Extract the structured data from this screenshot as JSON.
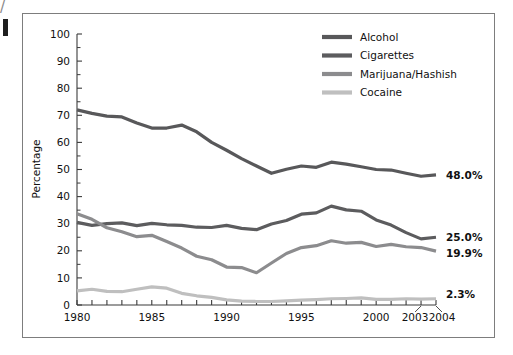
{
  "chart_data": {
    "type": "line",
    "title": "",
    "subtitle": "",
    "xlabel": "",
    "ylabel": "Percentage",
    "xlim": [
      1980,
      2004
    ],
    "ylim": [
      0,
      100
    ],
    "grid": false,
    "legend_position": "top-right",
    "x": [
      1980,
      1981,
      1982,
      1983,
      1984,
      1985,
      1986,
      1987,
      1988,
      1989,
      1990,
      1991,
      1992,
      1993,
      1994,
      1995,
      1996,
      1997,
      1998,
      1999,
      2000,
      2001,
      2002,
      2003,
      2004
    ],
    "xticks": [
      1980,
      1985,
      1990,
      1995,
      2000,
      2003,
      2004
    ],
    "xticklabels": [
      "1980",
      "1985",
      "1990",
      "1995",
      "2000",
      "2003",
      "2004"
    ],
    "yticks": [
      0,
      10,
      20,
      30,
      40,
      50,
      60,
      70,
      80,
      90,
      100
    ],
    "yticklabels": [
      "0",
      "10",
      "20",
      "30",
      "40",
      "50",
      "60",
      "70",
      "80",
      "90",
      "100"
    ],
    "yticks_minor": [
      5,
      15,
      25,
      35,
      45,
      55,
      65,
      75,
      85,
      95
    ],
    "series": [
      {
        "name": "Alcohol",
        "color": "#58585a",
        "end_label": "48.0%",
        "values": [
          72.0,
          70.7,
          69.7,
          69.4,
          67.2,
          65.3,
          65.3,
          66.4,
          63.9,
          60.0,
          57.1,
          54.0,
          51.3,
          48.6,
          50.1,
          51.3,
          50.8,
          52.7,
          52.0,
          51.0,
          50.0,
          49.8,
          48.6,
          47.5,
          48.0
        ]
      },
      {
        "name": "Cigarettes",
        "color": "#5c5c5e",
        "end_label": "25.0%",
        "values": [
          30.5,
          29.4,
          30.0,
          30.3,
          29.3,
          30.1,
          29.6,
          29.4,
          28.7,
          28.6,
          29.4,
          28.3,
          27.8,
          29.9,
          31.2,
          33.5,
          34.0,
          36.5,
          35.1,
          34.6,
          31.4,
          29.5,
          26.7,
          24.4,
          25.0
        ]
      },
      {
        "name": "Marijuana/Hashish",
        "color": "#8c8c8e",
        "end_label": "19.9%",
        "values": [
          33.7,
          31.6,
          28.5,
          27.0,
          25.2,
          25.7,
          23.4,
          21.0,
          18.0,
          16.7,
          14.0,
          13.8,
          11.9,
          15.5,
          19.0,
          21.2,
          21.9,
          23.7,
          22.8,
          23.1,
          21.6,
          22.4,
          21.5,
          21.2,
          19.9
        ]
      },
      {
        "name": "Cocaine",
        "color": "#bfbfbf",
        "end_label": "2.3%",
        "values": [
          5.2,
          5.8,
          5.0,
          4.9,
          5.8,
          6.7,
          6.2,
          4.3,
          3.4,
          2.8,
          1.9,
          1.4,
          1.3,
          1.3,
          1.5,
          1.8,
          2.0,
          2.3,
          2.4,
          2.6,
          2.1,
          2.1,
          2.3,
          2.2,
          2.3
        ]
      }
    ],
    "legend": [
      {
        "label": "Alcohol",
        "color": "#58585a"
      },
      {
        "label": "Cigarettes",
        "color": "#5c5c5e"
      },
      {
        "label": "Marijuana/Hashish",
        "color": "#8c8c8e"
      },
      {
        "label": "Cocaine",
        "color": "#bfbfbf"
      }
    ],
    "end_labels": [
      "48.0%",
      "25.0%",
      "19.9%",
      "2.3%"
    ]
  },
  "axis": {
    "ylabel": "Percentage"
  },
  "ticks": {
    "y": [
      "100",
      "90",
      "80",
      "70",
      "60",
      "50",
      "40",
      "30",
      "20",
      "10",
      "0"
    ],
    "x": [
      "1980",
      "1985",
      "1990",
      "1995",
      "2000",
      "2003",
      "2004"
    ]
  },
  "legend": {
    "items": [
      {
        "label": "Alcohol"
      },
      {
        "label": "Cigarettes"
      },
      {
        "label": "Marijuana/Hashish"
      },
      {
        "label": "Cocaine"
      }
    ]
  },
  "end_labels": {
    "alcohol": "48.0%",
    "cigarettes": "25.0%",
    "marijuana": "19.9%",
    "cocaine": "2.3%"
  }
}
